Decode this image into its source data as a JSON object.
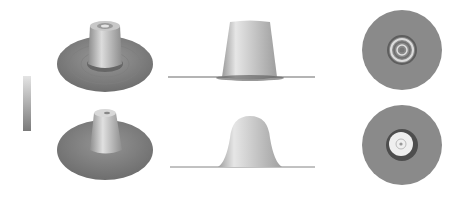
{
  "figure": {
    "rows": [
      {
        "name": "row-1",
        "views": [
          "oblique",
          "side",
          "top"
        ]
      },
      {
        "name": "row-2",
        "views": [
          "oblique",
          "side",
          "top"
        ]
      }
    ],
    "colorbar": {
      "orientation": "vertical",
      "colormap": "grayscale",
      "tick_labels": [
        "",
        "",
        "",
        "",
        ""
      ]
    },
    "colors": {
      "background": "#ffffff",
      "surface_base": "#8a8a8a",
      "surface_highlight": "#e8e8e8",
      "shadow": "#555555"
    }
  }
}
